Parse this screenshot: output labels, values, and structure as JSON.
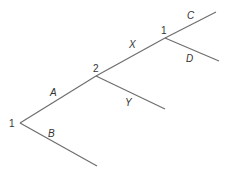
{
  "diagram": {
    "type": "tree",
    "colors": {
      "line": "#6e6e6e",
      "text": "#333333"
    },
    "nodes": [
      {
        "id": "root",
        "label": "1",
        "x": 20,
        "y": 123
      },
      {
        "id": "n2",
        "label": "2",
        "x": 96,
        "y": 76
      },
      {
        "id": "n1top",
        "label": "1",
        "x": 165,
        "y": 38
      }
    ],
    "edges": [
      {
        "id": "A",
        "label": "A",
        "from": [
          20,
          123
        ],
        "to": [
          96,
          76
        ]
      },
      {
        "id": "B",
        "label": "B",
        "from": [
          20,
          123
        ],
        "to": [
          97,
          166
        ]
      },
      {
        "id": "X",
        "label": "X",
        "from": [
          96,
          76
        ],
        "to": [
          165,
          38
        ]
      },
      {
        "id": "Y",
        "label": "Y",
        "from": [
          96,
          76
        ],
        "to": [
          165,
          109
        ]
      },
      {
        "id": "C",
        "label": "C",
        "from": [
          165,
          38
        ],
        "to": [
          216,
          12
        ]
      },
      {
        "id": "D",
        "label": "D",
        "from": [
          165,
          38
        ],
        "to": [
          219,
          61
        ]
      }
    ]
  }
}
